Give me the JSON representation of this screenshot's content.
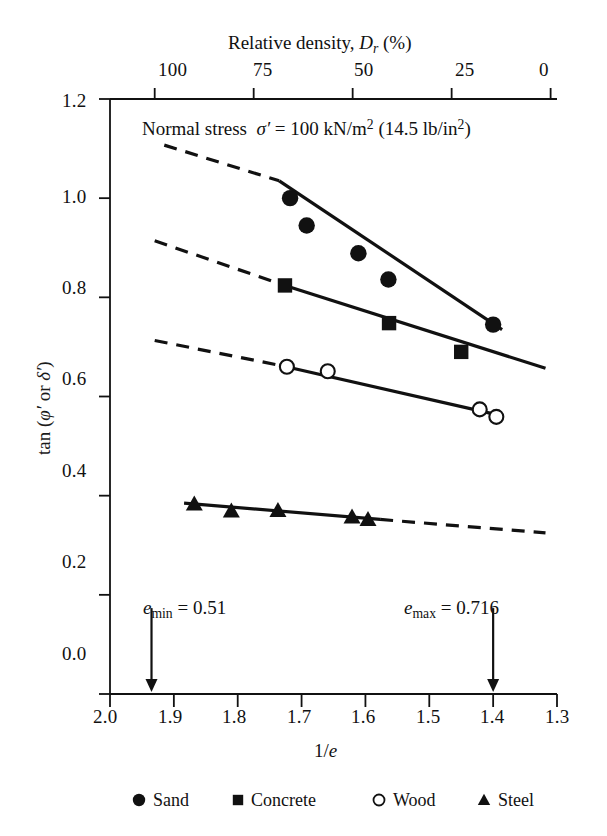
{
  "chart_data": {
    "type": "scatter",
    "xlabel": "1/e",
    "ylabel": "tan (φ' or δ')",
    "top_axis_label": "Relative density, D_r (%)",
    "xlim": [
      2.0,
      1.3
    ],
    "ylim": [
      0.0,
      1.2
    ],
    "x_ticks": [
      "2.0",
      "1.9",
      "1.8",
      "1.7",
      "1.6",
      "1.5",
      "1.4",
      "1.3"
    ],
    "x_tick_values": [
      2.0,
      1.9,
      1.8,
      1.7,
      1.6,
      1.5,
      1.4,
      1.3
    ],
    "y_ticks": [
      "0.0",
      "0.2",
      "0.4",
      "0.6",
      "0.8",
      "1.0",
      "1.2"
    ],
    "y_tick_values": [
      0.0,
      0.2,
      0.4,
      0.6,
      0.8,
      1.0,
      1.2
    ],
    "top_ticks": [
      "100",
      "75",
      "50",
      "25",
      "0"
    ],
    "top_tick_values": [
      100,
      75,
      50,
      25,
      0
    ],
    "top_tick_x": [
      1.93,
      1.775,
      1.62,
      1.465,
      1.31
    ],
    "grid": false,
    "legend_position": "bottom",
    "annotations": [
      {
        "name": "e-min",
        "text": "e_min = 0.51",
        "x": 1.935,
        "y": 0.145,
        "arrow": "down"
      },
      {
        "name": "e-max",
        "text": "e_max = 0.716",
        "x": 1.4,
        "y": 0.145,
        "arrow": "down"
      }
    ],
    "series": [
      {
        "name": "Sand",
        "marker": "filled-circle",
        "points": [
          {
            "x": 1.718,
            "y": 1.0
          },
          {
            "x": 1.692,
            "y": 0.945
          },
          {
            "x": 1.611,
            "y": 0.889
          },
          {
            "x": 1.564,
            "y": 0.836
          },
          {
            "x": 1.4,
            "y": 0.745
          }
        ],
        "fit_solid": {
          "x1": 1.735,
          "y1": 1.035,
          "x2": 1.386,
          "y2": 0.735
        },
        "fit_dashed": {
          "x1": 1.915,
          "y1": 1.107,
          "x2": 1.735,
          "y2": 1.035
        }
      },
      {
        "name": "Concrete",
        "marker": "filled-square",
        "points": [
          {
            "x": 1.726,
            "y": 0.824
          },
          {
            "x": 1.563,
            "y": 0.748
          },
          {
            "x": 1.45,
            "y": 0.69
          }
        ],
        "fit_solid": {
          "x1": 1.731,
          "y1": 0.826,
          "x2": 1.318,
          "y2": 0.657
        },
        "fit_dashed": {
          "x1": 1.93,
          "y1": 0.914,
          "x2": 1.731,
          "y2": 0.826
        }
      },
      {
        "name": "Wood",
        "marker": "open-circle",
        "points": [
          {
            "x": 1.723,
            "y": 0.66
          },
          {
            "x": 1.659,
            "y": 0.651
          },
          {
            "x": 1.421,
            "y": 0.574
          },
          {
            "x": 1.395,
            "y": 0.559
          }
        ],
        "fit_solid": {
          "x1": 1.731,
          "y1": 0.662,
          "x2": 1.386,
          "y2": 0.561
        },
        "fit_dashed": {
          "x1": 1.93,
          "y1": 0.713,
          "x2": 1.731,
          "y2": 0.662
        }
      },
      {
        "name": "Steel",
        "marker": "filled-triangle",
        "points": [
          {
            "x": 1.868,
            "y": 0.383
          },
          {
            "x": 1.81,
            "y": 0.369
          },
          {
            "x": 1.737,
            "y": 0.37
          },
          {
            "x": 1.621,
            "y": 0.357
          },
          {
            "x": 1.596,
            "y": 0.352
          }
        ],
        "fit_solid": {
          "x1": 1.884,
          "y1": 0.385,
          "x2": 1.577,
          "y2": 0.352
        },
        "fit_dashed": {
          "x1": 1.577,
          "y1": 0.352,
          "x2": 1.318,
          "y2": 0.325
        }
      }
    ]
  },
  "top_axis": {
    "title_prefix": "Relative density, ",
    "title_var": "D",
    "title_sub": "r",
    "title_suffix": " (%)",
    "ticks": [
      "100",
      "75",
      "50",
      "25",
      "0"
    ]
  },
  "plot_note": {
    "prefix": "Normal stress",
    "sigma": "σ′",
    "equals": "=",
    "value": "100 kN/m",
    "exp1": "2",
    "paren": "(14.5 lb/in",
    "exp2": "2",
    "close": ")"
  },
  "y_axis": {
    "title_prefix": "tan (",
    "title_phi": "φ′",
    "title_or": " or ",
    "title_delta": "δ′",
    "title_close": ")",
    "ticks": [
      "1.2",
      "1.0",
      "0.8",
      "0.6",
      "0.4",
      "0.2",
      "0.0"
    ]
  },
  "x_axis": {
    "title_num": "1/",
    "title_var": "e",
    "ticks": [
      "2.0",
      "1.9",
      "1.8",
      "1.7",
      "1.6",
      "1.5",
      "1.4",
      "1.3"
    ]
  },
  "annotations": {
    "e_min": {
      "var": "e",
      "sub": "min",
      "rest": " = 0.51"
    },
    "e_max": {
      "var": "e",
      "sub": "max",
      "rest": " = 0.716"
    }
  },
  "legend": {
    "items": [
      {
        "label": "Sand",
        "marker": "filled-circle"
      },
      {
        "label": "Concrete",
        "marker": "filled-square"
      },
      {
        "label": "Wood",
        "marker": "open-circle"
      },
      {
        "label": "Steel",
        "marker": "filled-triangle"
      }
    ]
  },
  "colors": {
    "ink": "#111111",
    "background": "#ffffff"
  }
}
